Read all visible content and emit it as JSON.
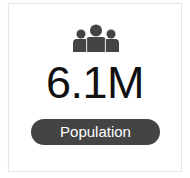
{
  "card": {
    "icon": "people-group-icon",
    "value": "6.1M",
    "label": "Population"
  },
  "colors": {
    "icon": "#444444",
    "value": "#111111",
    "pill_bg": "#444444",
    "pill_text": "#ffffff",
    "border": "#e6e6e6"
  }
}
